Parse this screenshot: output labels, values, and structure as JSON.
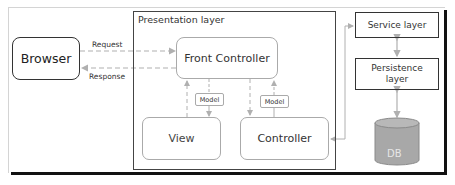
{
  "diagram": {
    "type": "architecture",
    "nodes": {
      "browser": "Browser",
      "presentation_layer": "Presentation layer",
      "front_controller": "Front Controller",
      "view": "View",
      "controller": "Controller",
      "model_1": "Model",
      "model_2": "Model",
      "service_layer": "Service layer",
      "persistence_layer_line1": "Persistence",
      "persistence_layer_line2": "layer",
      "db": "DB"
    },
    "edges": {
      "request": "Request",
      "response": "Response"
    },
    "colors": {
      "box_border_dark": "#333333",
      "box_border_light": "#aaaaaa",
      "arrow": "#b0b0b0",
      "db_fill": "#a8a8a8",
      "shadow": "#111111"
    }
  }
}
